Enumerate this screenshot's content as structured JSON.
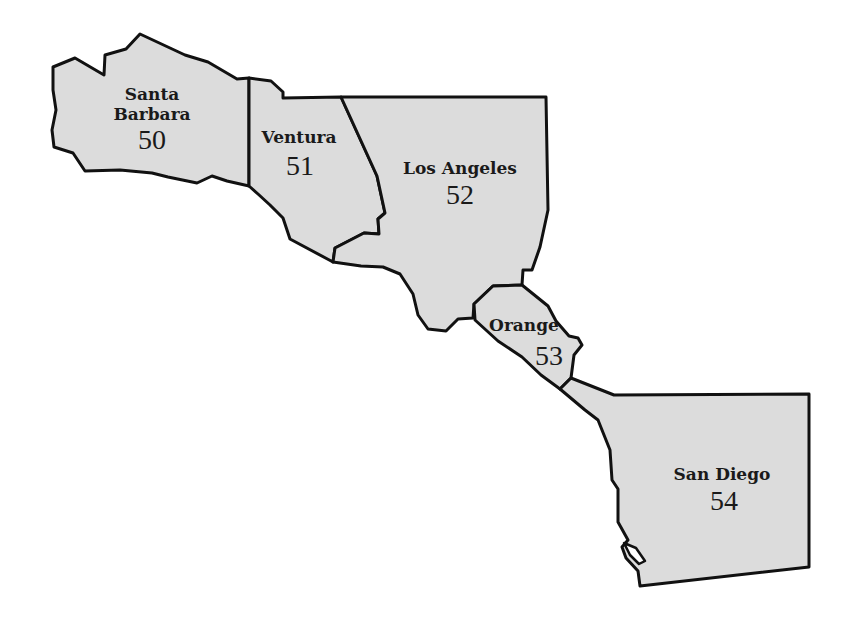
{
  "map": {
    "fill_color": "#dcdcdc",
    "stroke_color": "#111111",
    "counties": [
      {
        "name_line1": "Santa",
        "name_line2": "Barbara",
        "number": "50"
      },
      {
        "name": "Ventura",
        "number": "51"
      },
      {
        "name": "Los Angeles",
        "number": "52"
      },
      {
        "name": "Orange",
        "number": "53"
      },
      {
        "name": "San Diego",
        "number": "54"
      }
    ]
  }
}
